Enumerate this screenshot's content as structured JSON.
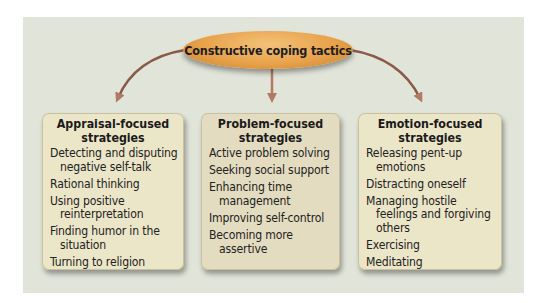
{
  "diagram": {
    "root": {
      "label": "Constructive coping tactics"
    },
    "categories": [
      {
        "title": "Appraisal-focused strategies",
        "title_line1": "Appraisal-focused",
        "title_line2": "strategies",
        "items": [
          "Detecting and disputing negative self-talk",
          "Rational thinking",
          "Using positive reinterpretation",
          "Finding humor in the situation",
          "Turning to religion"
        ]
      },
      {
        "title": "Problem-focused strategies",
        "title_line1": "Problem-focused",
        "title_line2": "strategies",
        "items": [
          "Active problem solving",
          "Seeking social support",
          "Enhancing time management",
          "Improving self-control",
          "Becoming more assertive"
        ]
      },
      {
        "title": "Emotion-focused strategies",
        "title_line1": "Emotion-focused",
        "title_line2": "strategies",
        "items": [
          "Releasing pent-up emotions",
          "Distracting oneself",
          "Managing hostile feelings and forgiving others",
          "Exercising",
          "Meditating",
          "Using systematic relaxation procedures"
        ]
      }
    ],
    "colors": {
      "background": "#e1e4d9",
      "root_fill": "#e8a24a",
      "arrow": "#8a5a48",
      "box_fill": "#ece6c9"
    }
  }
}
